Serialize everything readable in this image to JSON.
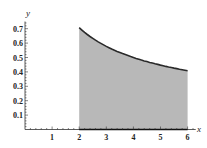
{
  "chart_data": {
    "type": "area",
    "title": "",
    "xlabel": "x",
    "ylabel": "y",
    "function": "y = 1/sqrt(x)",
    "shaded_interval": [
      2,
      6
    ],
    "x_ticks": [
      "1",
      "2",
      "3",
      "4",
      "5",
      "6"
    ],
    "y_ticks": [
      "0.1",
      "0.2",
      "0.3",
      "0.4",
      "0.5",
      "0.6",
      "0.7"
    ],
    "xlim": [
      0,
      6.3
    ],
    "ylim": [
      0,
      0.75
    ],
    "grid": false,
    "x": [
      2,
      2.5,
      3,
      3.5,
      4,
      4.5,
      5,
      5.5,
      6
    ],
    "values": [
      0.707,
      0.632,
      0.577,
      0.535,
      0.5,
      0.471,
      0.447,
      0.426,
      0.408
    ],
    "colors": {
      "fill": "#b8b8b8",
      "curve": "#2a2a2a",
      "axis": "#333333"
    }
  }
}
